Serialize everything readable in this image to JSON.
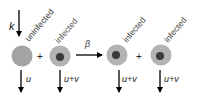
{
  "diagram": {
    "inflow_rate_label": "k",
    "infection_rate_label": "β",
    "plus_sign": "+",
    "cells": [
      {
        "label": "uninfected",
        "type": "uninfected",
        "decay_label": "u"
      },
      {
        "label": "infected",
        "type": "infected",
        "decay_label": "u+v"
      },
      {
        "label": "infected",
        "type": "infected",
        "decay_label": "u+v"
      },
      {
        "label": "infected",
        "type": "infected",
        "decay_label": "u+v"
      }
    ],
    "colors": {
      "uninfected_cell": "#a3a3a3",
      "infected_outer": "#b3b3b3",
      "infected_nucleus": "#3a3a3a",
      "arrow": "#000000",
      "label": "#333333"
    }
  }
}
